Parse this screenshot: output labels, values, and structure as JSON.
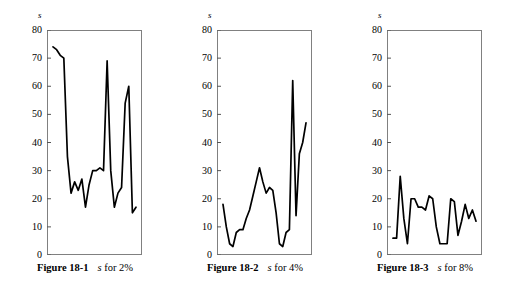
{
  "page": {
    "background": "#ffffff",
    "line_color": "#000000",
    "frame_color": "#808080"
  },
  "figures": [
    {
      "id": "figure-18-1",
      "caption_label": "Figure 18-1",
      "caption_var": "s",
      "caption_rest": "for 2%",
      "axis_title": "s",
      "chart_data": {
        "type": "line",
        "title": "Figure 18-1  s for 2%",
        "xlabel": "",
        "ylabel": "s",
        "ylim": [
          0,
          80
        ],
        "yticks": [
          0,
          10,
          20,
          30,
          40,
          50,
          60,
          70,
          80
        ],
        "grid": false,
        "legend": "none",
        "x": [
          1,
          2,
          3,
          4,
          5,
          6,
          7,
          8,
          9,
          10,
          11,
          12,
          13,
          14,
          15,
          16,
          17,
          18,
          19,
          20,
          21,
          22,
          23
        ],
        "values": [
          74,
          73,
          71,
          70,
          35,
          22,
          26,
          23,
          27,
          17,
          25,
          30,
          30,
          31,
          30,
          69,
          30,
          17,
          22,
          24,
          54,
          60,
          15,
          17
        ]
      }
    },
    {
      "id": "figure-18-2",
      "caption_label": "Figure 18-2",
      "caption_var": "s",
      "caption_rest": "for 4%",
      "axis_title": "s",
      "chart_data": {
        "type": "line",
        "title": "Figure 18-2  s for 4%",
        "xlabel": "",
        "ylabel": "s",
        "ylim": [
          0,
          80
        ],
        "yticks": [
          0,
          10,
          20,
          30,
          40,
          50,
          60,
          70,
          80
        ],
        "grid": false,
        "legend": "none",
        "x": [
          1,
          2,
          3,
          4,
          5,
          6,
          7,
          8,
          9,
          10,
          11,
          12,
          13,
          14,
          15,
          16,
          17,
          18,
          19,
          20,
          21,
          22
        ],
        "values": [
          18,
          10,
          4,
          3,
          8,
          9,
          9,
          13,
          16,
          21,
          26,
          31,
          26,
          22,
          24,
          23,
          15,
          4,
          3,
          8,
          9,
          62,
          14,
          36,
          40,
          47
        ]
      }
    },
    {
      "id": "figure-18-3",
      "caption_label": "Figure 18-3",
      "caption_var": "s",
      "caption_rest": "for 8%",
      "axis_title": "s",
      "chart_data": {
        "type": "line",
        "title": "Figure 18-3  s for 8%",
        "xlabel": "",
        "ylabel": "s",
        "ylim": [
          0,
          80
        ],
        "yticks": [
          0,
          10,
          20,
          30,
          40,
          50,
          60,
          70,
          80
        ],
        "grid": false,
        "legend": "none",
        "x": [
          1,
          2,
          3,
          4,
          5,
          6,
          7,
          8,
          9,
          10,
          11,
          12,
          13,
          14,
          15,
          16,
          17,
          18,
          19,
          20,
          21,
          22,
          23,
          24
        ],
        "values": [
          6,
          6,
          28,
          13,
          4,
          20,
          20,
          17,
          17,
          16,
          21,
          20,
          10,
          4,
          4,
          4,
          20,
          19,
          7,
          12,
          18,
          13,
          16,
          12
        ]
      }
    }
  ]
}
